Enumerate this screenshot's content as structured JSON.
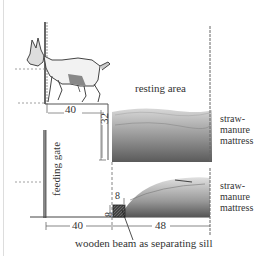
{
  "diagram": {
    "labels": {
      "resting_area": "resting area",
      "mattress_upper": [
        "straw-",
        "manure",
        "mattress"
      ],
      "mattress_lower": [
        "straw-",
        "manure",
        "mattress"
      ],
      "feeding_gate": "feeding gate",
      "sill": "wooden beam as separating sill"
    },
    "dimensions": {
      "upper_width": "40",
      "upper_height": "32",
      "lower_width_left": "40",
      "lower_width_right": "48",
      "beam_width": "8",
      "beam_height": "8"
    },
    "colors": {
      "line": "#555555",
      "straw_dark": "#555555",
      "straw_light": "#bbbbbb",
      "beam": "#333333"
    }
  }
}
